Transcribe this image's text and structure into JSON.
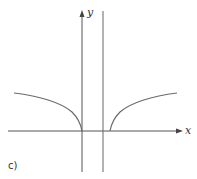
{
  "figure": {
    "part_label": "c)",
    "x_axis_label": "x",
    "y_axis_label": "y",
    "colors": {
      "axis": "#555555",
      "curve": "#6a6a6a",
      "asymptote": "#666666",
      "background": "#ffffff"
    }
  }
}
